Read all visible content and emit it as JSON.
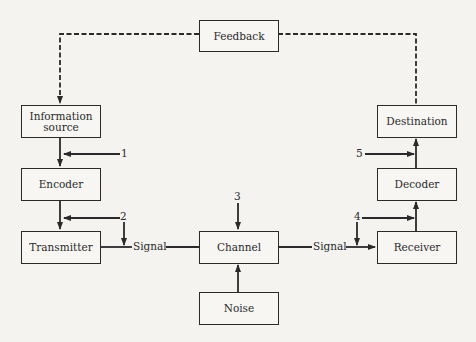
{
  "diagram": {
    "nodes": {
      "feedback": {
        "label": "Feedback"
      },
      "information_source": {
        "label": "Information source",
        "line1": "Information",
        "line2": "source"
      },
      "encoder": {
        "label": "Encoder"
      },
      "transmitter": {
        "label": "Transmitter"
      },
      "channel": {
        "label": "Channel"
      },
      "noise": {
        "label": "Noise"
      },
      "receiver": {
        "label": "Receiver"
      },
      "decoder": {
        "label": "Decoder"
      },
      "destination": {
        "label": "Destination"
      }
    },
    "labels": {
      "signal_left": "Signal",
      "signal_right": "Signal",
      "n1": "1",
      "n2": "2",
      "n3": "3",
      "n4": "4",
      "n5": "5"
    },
    "edges": [
      {
        "from": "information_source",
        "to": "encoder",
        "style": "solid"
      },
      {
        "from": "encoder",
        "to": "transmitter",
        "style": "solid"
      },
      {
        "from": "transmitter",
        "to": "channel",
        "label": "Signal",
        "style": "solid"
      },
      {
        "from": "noise",
        "to": "channel",
        "style": "solid"
      },
      {
        "from": "channel",
        "to": "receiver",
        "label": "Signal",
        "style": "solid"
      },
      {
        "from": "receiver",
        "to": "decoder",
        "style": "solid"
      },
      {
        "from": "decoder",
        "to": "destination",
        "style": "solid"
      },
      {
        "from": "destination",
        "to": "feedback",
        "style": "dashed"
      },
      {
        "from": "feedback",
        "to": "information_source",
        "style": "dashed"
      },
      {
        "from": "1",
        "to": "information_source->encoder",
        "style": "solid"
      },
      {
        "from": "2",
        "to": "encoder->transmitter",
        "style": "solid"
      },
      {
        "from": "2",
        "to": "transmitter->channel",
        "style": "solid"
      },
      {
        "from": "3",
        "to": "channel",
        "style": "solid"
      },
      {
        "from": "4",
        "to": "receiver->decoder",
        "style": "solid"
      },
      {
        "from": "4",
        "to": "channel->receiver",
        "style": "solid"
      },
      {
        "from": "5",
        "to": "decoder->destination",
        "style": "solid"
      }
    ]
  }
}
